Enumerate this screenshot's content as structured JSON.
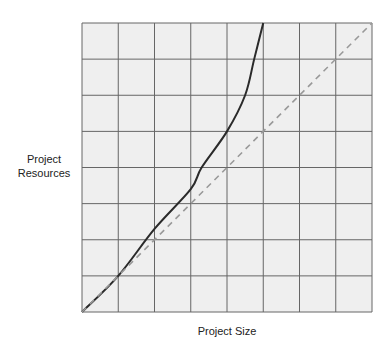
{
  "chart_data": {
    "type": "line",
    "title": "",
    "xlabel": "Project Size",
    "ylabel": "Project Resources",
    "xlim": [
      0,
      8
    ],
    "ylim": [
      0,
      8
    ],
    "grid": true,
    "grid_cells": 8,
    "tick_labels": false,
    "legend": null,
    "series": [
      {
        "name": "actual",
        "style": "solid",
        "color": "#2a2a2a",
        "x": [
          0,
          1,
          2,
          3,
          3.3,
          4,
          4.5,
          4.75,
          5
        ],
        "y": [
          0,
          1,
          2.3,
          3.4,
          4,
          5,
          6,
          7,
          8
        ]
      },
      {
        "name": "linear",
        "style": "dashed",
        "color": "#999999",
        "x": [
          0,
          8
        ],
        "y": [
          0,
          8
        ]
      }
    ]
  },
  "colors": {
    "plot_bg": "#efefef",
    "grid": "#666666"
  }
}
